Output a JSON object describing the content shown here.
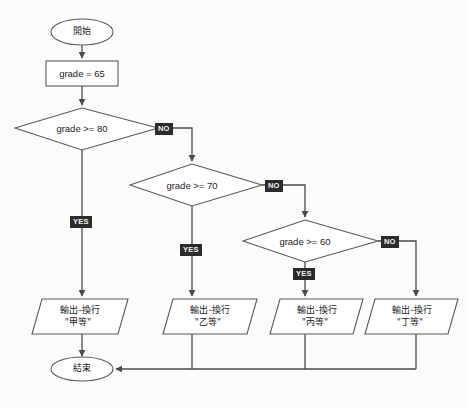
{
  "diagram": {
    "type": "flowchart",
    "colors": {
      "background": "#fbfbfa",
      "stroke": "#4a4a4a",
      "shape_fill": "#ffffff",
      "text": "#1b1b1b",
      "label_background": "#2b2b2b",
      "label_text": "#f2f2f2"
    },
    "nodes": {
      "start": {
        "shape": "ellipse",
        "label": "開始"
      },
      "init": {
        "shape": "process",
        "label": "grade = 65"
      },
      "decision1": {
        "shape": "decision",
        "label": "grade >= 80"
      },
      "decision2": {
        "shape": "decision",
        "label": "grade >= 70"
      },
      "decision3": {
        "shape": "decision",
        "label": "grade >= 60"
      },
      "output1": {
        "shape": "parallelogram",
        "line1": "輸出-換行",
        "line2": "\"甲等\""
      },
      "output2": {
        "shape": "parallelogram",
        "line1": "輸出-換行",
        "line2": "\"乙等\""
      },
      "output3": {
        "shape": "parallelogram",
        "line1": "輸出-換行",
        "line2": "\"丙等\""
      },
      "output4": {
        "shape": "parallelogram",
        "line1": "輸出-換行",
        "line2": "\"丁等\""
      },
      "end": {
        "shape": "ellipse",
        "label": "結束"
      }
    },
    "edge_labels": {
      "d1_no": "NO",
      "d1_yes": "YES",
      "d2_no": "NO",
      "d2_yes": "YES",
      "d3_no": "NO",
      "d3_yes": "YES"
    }
  }
}
